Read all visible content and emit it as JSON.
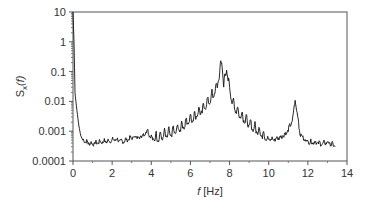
{
  "chart_data": {
    "type": "line",
    "title": "",
    "xlabel_italic": "f",
    "xlabel_unit": "[Hz]",
    "ylabel_main": "S",
    "ylabel_sub": "x",
    "ylabel_arg": "(f)",
    "xlim": [
      0,
      14
    ],
    "ylim": [
      0.0001,
      10
    ],
    "yscale": "log",
    "grid": false,
    "legend": null,
    "x_ticks": [
      "0",
      "2",
      "4",
      "6",
      "8",
      "10",
      "12",
      "14"
    ],
    "y_ticks": [
      "10",
      "1",
      "0.1",
      "0.01",
      "0.001",
      "0.0001"
    ],
    "annotations": [],
    "series": [
      {
        "name": "S_x(f)",
        "color": "#111111",
        "x": [
          0.0,
          0.05,
          0.1,
          0.2,
          0.3,
          0.4,
          0.5,
          0.7,
          1.0,
          1.3,
          1.6,
          1.9,
          2.2,
          2.5,
          2.8,
          3.1,
          3.4,
          3.7,
          3.8,
          3.9,
          4.1,
          4.4,
          4.7,
          5.0,
          5.3,
          5.6,
          5.9,
          6.2,
          6.5,
          6.8,
          7.1,
          7.3,
          7.45,
          7.6,
          7.7,
          7.85,
          8.0,
          8.2,
          8.5,
          8.8,
          9.1,
          9.4,
          9.7,
          10.0,
          10.3,
          10.6,
          10.9,
          11.2,
          11.35,
          11.45,
          11.6,
          11.8,
          12.1,
          12.4,
          12.7,
          13.0,
          13.4
        ],
        "values": [
          10,
          1.0,
          0.02,
          0.005,
          0.0015,
          0.0007,
          0.0005,
          0.0004,
          0.00035,
          0.0004,
          0.00042,
          0.00045,
          0.0005,
          0.00042,
          0.0005,
          0.0006,
          0.0006,
          0.0008,
          0.0011,
          0.0007,
          0.0005,
          0.0005,
          0.0006,
          0.0007,
          0.0009,
          0.0012,
          0.0018,
          0.0025,
          0.004,
          0.006,
          0.012,
          0.02,
          0.05,
          0.2,
          0.03,
          0.1,
          0.02,
          0.006,
          0.003,
          0.002,
          0.0012,
          0.0009,
          0.0006,
          0.0005,
          0.0005,
          0.0006,
          0.0008,
          0.002,
          0.01,
          0.004,
          0.0008,
          0.0005,
          0.0004,
          0.0004,
          0.00035,
          0.0004,
          0.0003
        ]
      }
    ]
  }
}
